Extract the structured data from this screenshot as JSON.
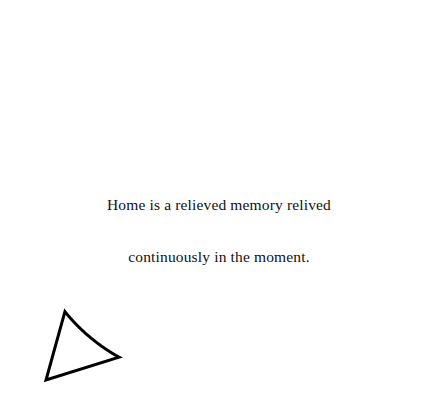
{
  "canvas": {
    "width": 430,
    "height": 411,
    "background_color": "#ffffff"
  },
  "bubble": {
    "shape": "speech-balloon",
    "outline_color": "#000000",
    "fill_color": "#ffffff",
    "stroke_width": 3,
    "ellipse": {
      "center_x": 215,
      "center_y": 205,
      "radius_x": 188,
      "radius_y": 177
    },
    "tail": {
      "direction": "bottom-left",
      "style": "angular-pointed",
      "attach_upper_x": 63,
      "attach_upper_y": 313,
      "tip_x": 46,
      "tip_y": 380,
      "attach_lower_x": 118,
      "attach_lower_y": 359
    }
  },
  "message": {
    "line_1": "Home is a relieved memory relived",
    "line_2": "continuously in the moment.",
    "full_text": "Home is a relieved memory relived continuously in the moment.",
    "text_color": "#111111",
    "alignment": "center"
  }
}
